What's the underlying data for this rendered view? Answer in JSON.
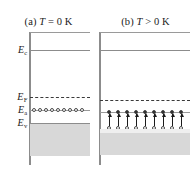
{
  "figure": {
    "type": "energy-band-diagram",
    "width": 194,
    "height": 169,
    "background": "#ffffff"
  },
  "colors": {
    "axis": "#8c8c8c",
    "level_line": "#8c8c8c",
    "fermi_dashed": "#3a3a3a",
    "valence_fill": "#d8d8d8",
    "valence_fill_light": "#e2e2e2",
    "circle_stroke": "#4a4a4a",
    "arrow": "#1a1a1a",
    "text": "#1a1a1a"
  },
  "panels": [
    {
      "id": "a",
      "title_prefix": "(a)",
      "title_symbol": "T",
      "title_relation": "=",
      "title_value": "0 K",
      "title_full": "(a) T = 0 K",
      "levels": [
        {
          "name": "top-band-line",
          "label": "",
          "y": 32,
          "style": "solid"
        },
        {
          "name": "conduction-band-edge",
          "label": "E",
          "sub": "c",
          "y": 50,
          "style": "solid"
        },
        {
          "name": "fermi-level",
          "label": "E",
          "sub": "F",
          "y": 97,
          "style": "dashed"
        },
        {
          "name": "acceptor-level",
          "label": "E",
          "sub": "a",
          "y": 110,
          "style": "solid"
        },
        {
          "name": "valence-band-edge",
          "label": "E",
          "sub": "v",
          "y": 123,
          "style": "solid"
        }
      ],
      "valence_band": {
        "top_y": 123,
        "bottom_y": 155,
        "filled": true
      },
      "acceptor_circles": {
        "count": 10,
        "filled": false,
        "on_level": "acceptor-level"
      },
      "valence_circles": {
        "count": 0
      },
      "arrows": {
        "count": 0
      }
    },
    {
      "id": "b",
      "title_prefix": "(b)",
      "title_symbol": "T",
      "title_relation": ">",
      "title_value": "0 K",
      "title_full": "(b) T > 0 K",
      "levels": [
        {
          "name": "top-band-line",
          "label": "",
          "y": 32,
          "style": "solid"
        },
        {
          "name": "conduction-band-edge",
          "label": "",
          "sub": "c",
          "y": 50,
          "style": "solid"
        },
        {
          "name": "fermi-level",
          "label": "",
          "sub": "F",
          "y": 100,
          "style": "dashed"
        },
        {
          "name": "acceptor-level",
          "label": "",
          "sub": "a",
          "y": 112,
          "style": "solid"
        },
        {
          "name": "valence-band-edge",
          "label": "",
          "sub": "v",
          "y": 129,
          "style": "solid"
        }
      ],
      "valence_band": {
        "top_y": 129,
        "bottom_y": 155,
        "filled": true
      },
      "acceptor_circles": {
        "count": 9,
        "filled": true,
        "on_level": "acceptor-level"
      },
      "valence_circles": {
        "count": 9,
        "filled": false,
        "on_level": "valence-band-edge"
      },
      "arrows": {
        "count": 9,
        "direction": "up",
        "from_level": "valence-band-edge",
        "to_level": "acceptor-level"
      }
    }
  ]
}
